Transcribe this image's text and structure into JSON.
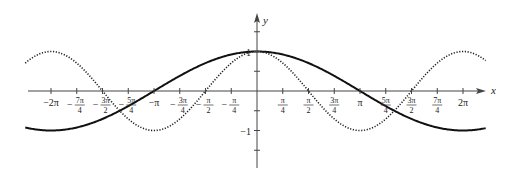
{
  "chart_data": {
    "type": "line",
    "title": "",
    "xlabel": "x",
    "ylabel": "y",
    "xlim": [
      -2.25,
      2.22
    ],
    "xlim_units": "pi",
    "ylim": [
      -1.95,
      1.95
    ],
    "grid": false,
    "legend": null,
    "x_ticks": [
      {
        "value_pi": -2,
        "label": "−2π",
        "frac": false
      },
      {
        "value_pi": -1.75,
        "num": "7π",
        "den": "4",
        "sign": "−",
        "frac": true
      },
      {
        "value_pi": -1.5,
        "num": "3π",
        "den": "2",
        "sign": "−",
        "frac": true
      },
      {
        "value_pi": -1.25,
        "num": "5π",
        "den": "4",
        "sign": "−",
        "frac": true
      },
      {
        "value_pi": -1,
        "label": "−π",
        "frac": false
      },
      {
        "value_pi": -0.75,
        "num": "3π",
        "den": "4",
        "sign": "−",
        "frac": true
      },
      {
        "value_pi": -0.5,
        "num": "π",
        "den": "2",
        "sign": "−",
        "frac": true
      },
      {
        "value_pi": -0.25,
        "num": "π",
        "den": "4",
        "sign": "−",
        "frac": true
      },
      {
        "value_pi": 0.25,
        "num": "π",
        "den": "4",
        "sign": "",
        "frac": true
      },
      {
        "value_pi": 0.5,
        "num": "π",
        "den": "2",
        "sign": "",
        "frac": true
      },
      {
        "value_pi": 0.75,
        "num": "3π",
        "den": "4",
        "sign": "",
        "frac": true
      },
      {
        "value_pi": 1,
        "label": "π",
        "frac": false
      },
      {
        "value_pi": 1.25,
        "num": "5π",
        "den": "4",
        "sign": "",
        "frac": true
      },
      {
        "value_pi": 1.5,
        "num": "3π",
        "den": "2",
        "sign": "",
        "frac": true
      },
      {
        "value_pi": 1.75,
        "num": "7π",
        "den": "4",
        "sign": "",
        "frac": true
      },
      {
        "value_pi": 2,
        "label": "2π",
        "frac": false
      }
    ],
    "y_ticks": [
      {
        "value": 1.5,
        "label": ""
      },
      {
        "value": 1,
        "label": "1"
      },
      {
        "value": 0.5,
        "label": ""
      },
      {
        "value": -0.5,
        "label": ""
      },
      {
        "value": -1,
        "label": "−1"
      },
      {
        "value": -1.5,
        "label": ""
      }
    ],
    "series": [
      {
        "name": "y = cos(x/2)",
        "style": "solid",
        "function": "cos(x/2)",
        "color": "#111111",
        "sample_points": [
          [
            -2.2,
            -0.95
          ],
          [
            -2,
            -1
          ],
          [
            -1.5,
            -0.71
          ],
          [
            -1,
            0
          ],
          [
            -0.5,
            0.71
          ],
          [
            0,
            1
          ],
          [
            0.5,
            0.71
          ],
          [
            1,
            0
          ],
          [
            1.5,
            -0.71
          ],
          [
            2,
            -1
          ],
          [
            2.2,
            -0.95
          ]
        ]
      },
      {
        "name": "y = cos(x)",
        "style": "dotted",
        "function": "cos(x)",
        "color": "#222222",
        "sample_points": [
          [
            -2.2,
            0.81
          ],
          [
            -2,
            1
          ],
          [
            -1.5,
            0
          ],
          [
            -1,
            -1
          ],
          [
            -0.5,
            0
          ],
          [
            0,
            1
          ],
          [
            0.5,
            0
          ],
          [
            1,
            -1
          ],
          [
            1.5,
            0
          ],
          [
            2,
            1
          ],
          [
            2.2,
            0.81
          ]
        ]
      }
    ]
  },
  "labels": {
    "x_axis": "x",
    "y_axis": "y"
  },
  "colors": {
    "axis": "#444444",
    "solid_curve": "#111111",
    "dotted_curve": "#222222",
    "background": "#ffffff"
  }
}
